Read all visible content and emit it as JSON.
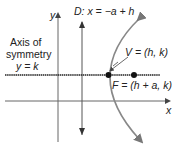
{
  "diagram": {
    "type": "parabola-horizontal-opening-right",
    "labels": {
      "y_axis": "y",
      "x_axis": "x",
      "directrix": "D: x = −a + h",
      "axis_of_symmetry_line1": "Axis of",
      "axis_of_symmetry_line2": "symmetry",
      "axis_of_symmetry_line3": "y = k",
      "vertex": "V = (h, k)",
      "focus": "F = (h + a, k)"
    },
    "colors": {
      "axes": "#555555",
      "curve": "#777777",
      "symmetry_line": "#222222",
      "points": "#111111",
      "text": "#222222"
    }
  }
}
